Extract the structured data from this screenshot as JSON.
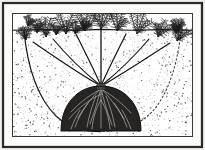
{
  "figure": {
    "title": "Shrub planted in a saucer-shaped planting hole",
    "type": "line-and-stipple botanical cross-section illustration",
    "view": "vertical cross-section through soil",
    "caption_text": "",
    "colors": {
      "paper": "#f2f1ef",
      "ink": "#1a1a1a",
      "frame_outer": "#2b2b2b",
      "frame_inner": "#3a3a3a",
      "rootball_fill": "#262524",
      "stipple": "#35332f",
      "backfill_light": "#ffffff"
    },
    "frame": {
      "outer_rect": [
        3,
        3,
        199,
        144
      ],
      "inner_rect": [
        12,
        13,
        181,
        124
      ],
      "outer_stroke_width": 2.2,
      "inner_stroke_width": 1.0
    }
  },
  "scene": {
    "ground_line": {
      "label": "soil surface line",
      "y": 30,
      "x_start": 13,
      "x_end": 192
    },
    "planting_hole": {
      "label": "saucer-shaped planting hole wall",
      "left_rim_x": 24,
      "right_rim_x": 181,
      "bottom_y": 131,
      "center_x": 101,
      "shape": "broad shallow bowl",
      "left_edge_style": "solid dark line",
      "right_edge_style": "faint dotted line"
    },
    "root_ball": {
      "label": "dark root ball with fibrous roots",
      "center_x": 101,
      "top_y": 86,
      "bottom_y": 131,
      "half_width": 40,
      "fibrous_root_count": 16
    },
    "crown": {
      "label": "crown where stems meet roots",
      "x": 101,
      "y": 86
    },
    "stems": {
      "label": "stems radiating from crown to ground level",
      "count": 7,
      "tip_xs": [
        33,
        53,
        76,
        101,
        126,
        149,
        170
      ],
      "tip_ys": [
        41,
        38,
        33,
        30,
        33,
        38,
        42
      ]
    },
    "foliage": {
      "label": "feathery branched foliage sprays above soil line",
      "spray_count": 9,
      "spray_xs": [
        26,
        46,
        66,
        85,
        101,
        117,
        137,
        158,
        177
      ],
      "spray_base_ys": [
        40,
        37,
        34,
        31,
        29,
        31,
        34,
        37,
        41
      ]
    },
    "stipple": {
      "label": "soil texture stipple dots",
      "density_outside_hole": "dense",
      "density_inside_hole": "sparse",
      "dot_count": 1150
    }
  }
}
